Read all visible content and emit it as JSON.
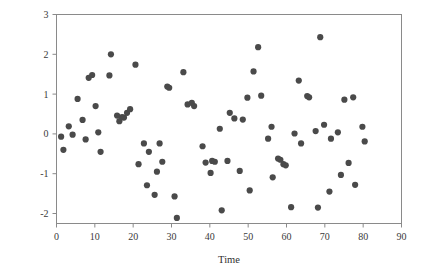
{
  "chart_data": {
    "type": "scatter",
    "title": "",
    "subtitle": "",
    "xlabel": "Time",
    "ylabel": "",
    "xlim": [
      0,
      90
    ],
    "ylim": [
      -2.25,
      3
    ],
    "xticks": [
      0,
      10,
      20,
      30,
      40,
      50,
      60,
      70,
      80,
      90
    ],
    "xticklabels": [
      "0",
      "10",
      "20",
      "30",
      "40",
      "50",
      "60",
      "70",
      "80",
      "90"
    ],
    "yticks": [
      -2,
      -1,
      0,
      1,
      2,
      3
    ],
    "yticklabels": [
      "-2",
      "-1",
      "0",
      "1",
      "2",
      "3"
    ],
    "grid": false,
    "legend": null,
    "marker": {
      "shape": "circle",
      "color": "#4a4a4a",
      "size_px": 3.1
    },
    "frame_color": "#8a8a8a",
    "background": "#ffffff",
    "n_points": 95,
    "series": [
      {
        "name": "observations",
        "color": "#4a4a4a",
        "points": [
          [
            1.2,
            -0.07
          ],
          [
            1.8,
            -0.4
          ],
          [
            3.2,
            0.19
          ],
          [
            4.2,
            -0.02
          ],
          [
            5.5,
            0.88
          ],
          [
            6.8,
            0.35
          ],
          [
            7.6,
            -0.14
          ],
          [
            8.4,
            1.41
          ],
          [
            9.3,
            1.48
          ],
          [
            10.2,
            0.7
          ],
          [
            10.9,
            0.04
          ],
          [
            11.5,
            -0.45
          ],
          [
            13.8,
            1.47
          ],
          [
            14.2,
            2.0
          ],
          [
            15.8,
            0.46
          ],
          [
            16.4,
            0.32
          ],
          [
            17.1,
            0.42
          ],
          [
            17.6,
            0.41
          ],
          [
            18.4,
            0.53
          ],
          [
            19.2,
            0.62
          ],
          [
            20.6,
            1.74
          ],
          [
            21.4,
            -0.76
          ],
          [
            22.8,
            -0.24
          ],
          [
            23.6,
            -1.29
          ],
          [
            24.1,
            -0.45
          ],
          [
            25.6,
            -1.53
          ],
          [
            26.2,
            -0.95
          ],
          [
            26.9,
            -0.24
          ],
          [
            27.6,
            -0.7
          ],
          [
            28.9,
            1.19
          ],
          [
            29.4,
            1.16
          ],
          [
            30.8,
            -1.57
          ],
          [
            31.4,
            -2.11
          ],
          [
            33.1,
            1.55
          ],
          [
            34.2,
            0.74
          ],
          [
            35.3,
            0.78
          ],
          [
            35.9,
            0.7
          ],
          [
            38.1,
            -0.31
          ],
          [
            38.9,
            -0.72
          ],
          [
            40.2,
            -0.98
          ],
          [
            40.6,
            -0.68
          ],
          [
            41.3,
            -0.7
          ],
          [
            42.6,
            0.13
          ],
          [
            43.1,
            -1.92
          ],
          [
            44.6,
            -0.68
          ],
          [
            45.2,
            0.53
          ],
          [
            46.4,
            0.39
          ],
          [
            47.8,
            -0.93
          ],
          [
            48.6,
            0.36
          ],
          [
            49.8,
            0.91
          ],
          [
            50.4,
            -1.42
          ],
          [
            51.4,
            1.57
          ],
          [
            52.6,
            2.18
          ],
          [
            53.4,
            0.96
          ],
          [
            55.2,
            -0.12
          ],
          [
            56.1,
            0.18
          ],
          [
            56.4,
            -1.09
          ],
          [
            57.8,
            -0.62
          ],
          [
            58.4,
            -0.65
          ],
          [
            59.2,
            -0.76
          ],
          [
            59.8,
            -0.79
          ],
          [
            61.2,
            -1.84
          ],
          [
            62.1,
            0.01
          ],
          [
            63.2,
            1.34
          ],
          [
            63.8,
            -0.24
          ],
          [
            65.4,
            0.95
          ],
          [
            65.9,
            0.92
          ],
          [
            67.6,
            0.07
          ],
          [
            68.2,
            -1.85
          ],
          [
            68.8,
            2.43
          ],
          [
            69.8,
            0.23
          ],
          [
            71.2,
            -1.45
          ],
          [
            71.6,
            -0.12
          ],
          [
            73.4,
            0.04
          ],
          [
            74.2,
            -1.03
          ],
          [
            75.1,
            0.86
          ],
          [
            76.2,
            -0.73
          ],
          [
            77.4,
            0.92
          ],
          [
            77.9,
            -1.28
          ],
          [
            79.8,
            0.18
          ],
          [
            80.4,
            -0.19
          ]
        ]
      }
    ]
  },
  "axis": {
    "x_title": "Time"
  }
}
